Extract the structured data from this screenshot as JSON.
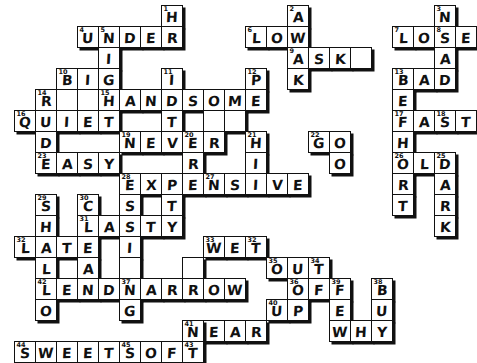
{
  "puzzle": {
    "type": "crossword",
    "title": "Opposites Crossword",
    "cell_size": 21,
    "origin": {
      "x": 14,
      "y": 5
    },
    "across_answers": [
      "UNDER",
      "LOW",
      "LOSE",
      "ASK",
      "BAD",
      "BIG",
      "HANDSOME",
      "QUIET",
      "EAST",
      "NEVER",
      "EASY",
      "EXPENSIVE",
      "OLD",
      "LAST",
      "LATE",
      "WET",
      "NARROW",
      "OUT",
      "LEND",
      "OF",
      "UP",
      "NEAR",
      "WHY",
      "SWEET",
      "SOFT"
    ],
    "down_answers": [
      "HIGH",
      "AWAKE",
      "NOISY",
      "SAD",
      "PRETTY",
      "BEFORE",
      "MORE",
      "SHORT",
      "DARK",
      "HIGH",
      "GOOD",
      "SHALLOW",
      "CLEAN",
      "THIN",
      "TIDY",
      "BUSY"
    ],
    "cells": [
      {
        "r": 0,
        "c": 7,
        "letter": "H",
        "num": "1"
      },
      {
        "r": 0,
        "c": 13,
        "letter": "A",
        "num": "2"
      },
      {
        "r": 0,
        "c": 20,
        "letter": "N",
        "num": "3"
      },
      {
        "r": 1,
        "c": 3,
        "letter": "U",
        "num": "4"
      },
      {
        "r": 1,
        "c": 4,
        "letter": "N",
        "num": "5"
      },
      {
        "r": 1,
        "c": 5,
        "letter": "D",
        "num": ""
      },
      {
        "r": 1,
        "c": 6,
        "letter": "E",
        "num": ""
      },
      {
        "r": 1,
        "c": 7,
        "letter": "R",
        "num": ""
      },
      {
        "r": 1,
        "c": 11,
        "letter": "L",
        "num": "6"
      },
      {
        "r": 1,
        "c": 12,
        "letter": "O",
        "num": ""
      },
      {
        "r": 1,
        "c": 13,
        "letter": "W",
        "num": ""
      },
      {
        "r": 1,
        "c": 18,
        "letter": "L",
        "num": "7"
      },
      {
        "r": 1,
        "c": 19,
        "letter": "O",
        "num": ""
      },
      {
        "r": 1,
        "c": 20,
        "letter": "S",
        "num": "8"
      },
      {
        "r": 1,
        "c": 21,
        "letter": "E",
        "num": ""
      },
      {
        "r": 2,
        "c": 4,
        "letter": "I",
        "num": ""
      },
      {
        "r": 2,
        "c": 13,
        "letter": "A",
        "num": "9"
      },
      {
        "r": 2,
        "c": 14,
        "letter": "S",
        "num": ""
      },
      {
        "r": 2,
        "c": 15,
        "letter": "K",
        "num": ""
      },
      {
        "r": 2,
        "c": 16,
        "letter": "",
        "num": ""
      },
      {
        "r": 2,
        "c": 20,
        "letter": "A",
        "num": ""
      },
      {
        "r": 3,
        "c": 2,
        "letter": "B",
        "num": "10"
      },
      {
        "r": 3,
        "c": 3,
        "letter": "I",
        "num": ""
      },
      {
        "r": 3,
        "c": 4,
        "letter": "G",
        "num": ""
      },
      {
        "r": 3,
        "c": 7,
        "letter": "I",
        "num": "11"
      },
      {
        "r": 3,
        "c": 11,
        "letter": "P",
        "num": "12"
      },
      {
        "r": 3,
        "c": 13,
        "letter": "K",
        "num": ""
      },
      {
        "r": 3,
        "c": 18,
        "letter": "B",
        "num": "13"
      },
      {
        "r": 3,
        "c": 19,
        "letter": "A",
        "num": ""
      },
      {
        "r": 3,
        "c": 20,
        "letter": "D",
        "num": ""
      },
      {
        "r": 4,
        "c": 1,
        "letter": "R",
        "num": "14"
      },
      {
        "r": 4,
        "c": 2,
        "letter": "",
        "num": ""
      },
      {
        "r": 4,
        "c": 3,
        "letter": "",
        "num": ""
      },
      {
        "r": 4,
        "c": 4,
        "letter": "H",
        "num": "15"
      },
      {
        "r": 4,
        "c": 5,
        "letter": "A",
        "num": ""
      },
      {
        "r": 4,
        "c": 6,
        "letter": "N",
        "num": ""
      },
      {
        "r": 4,
        "c": 7,
        "letter": "D",
        "num": ""
      },
      {
        "r": 4,
        "c": 8,
        "letter": "S",
        "num": ""
      },
      {
        "r": 4,
        "c": 9,
        "letter": "O",
        "num": ""
      },
      {
        "r": 4,
        "c": 10,
        "letter": "M",
        "num": ""
      },
      {
        "r": 4,
        "c": 11,
        "letter": "E",
        "num": ""
      },
      {
        "r": 4,
        "c": 18,
        "letter": "E",
        "num": ""
      },
      {
        "r": 5,
        "c": 0,
        "letter": "Q",
        "num": "16"
      },
      {
        "r": 5,
        "c": 1,
        "letter": "U",
        "num": ""
      },
      {
        "r": 5,
        "c": 2,
        "letter": "I",
        "num": ""
      },
      {
        "r": 5,
        "c": 3,
        "letter": "E",
        "num": ""
      },
      {
        "r": 5,
        "c": 4,
        "letter": "T",
        "num": ""
      },
      {
        "r": 5,
        "c": 7,
        "letter": "T",
        "num": ""
      },
      {
        "r": 5,
        "c": 9,
        "letter": "",
        "num": ""
      },
      {
        "r": 5,
        "c": 10,
        "letter": "",
        "num": ""
      },
      {
        "r": 5,
        "c": 18,
        "letter": "F",
        "num": "17"
      },
      {
        "r": 5,
        "c": 19,
        "letter": "A",
        "num": ""
      },
      {
        "r": 5,
        "c": 20,
        "letter": "S",
        "num": "18"
      },
      {
        "r": 5,
        "c": 21,
        "letter": "T",
        "num": ""
      },
      {
        "r": 6,
        "c": 1,
        "letter": "D",
        "num": ""
      },
      {
        "r": 6,
        "c": 5,
        "letter": "N",
        "num": "19"
      },
      {
        "r": 6,
        "c": 6,
        "letter": "E",
        "num": ""
      },
      {
        "r": 6,
        "c": 7,
        "letter": "V",
        "num": ""
      },
      {
        "r": 6,
        "c": 8,
        "letter": "E",
        "num": "20"
      },
      {
        "r": 6,
        "c": 9,
        "letter": "R",
        "num": ""
      },
      {
        "r": 6,
        "c": 11,
        "letter": "H",
        "num": "21"
      },
      {
        "r": 6,
        "c": 14,
        "letter": "G",
        "num": "22"
      },
      {
        "r": 6,
        "c": 15,
        "letter": "O",
        "num": ""
      },
      {
        "r": 6,
        "c": 18,
        "letter": "H",
        "num": ""
      },
      {
        "r": 7,
        "c": 1,
        "letter": "E",
        "num": "23"
      },
      {
        "r": 7,
        "c": 2,
        "letter": "A",
        "num": ""
      },
      {
        "r": 7,
        "c": 3,
        "letter": "S",
        "num": ""
      },
      {
        "r": 7,
        "c": 4,
        "letter": "Y",
        "num": ""
      },
      {
        "r": 7,
        "c": 8,
        "letter": "R",
        "num": ""
      },
      {
        "r": 7,
        "c": 11,
        "letter": "I",
        "num": ""
      },
      {
        "r": 7,
        "c": 15,
        "letter": "O",
        "num": ""
      },
      {
        "r": 7,
        "c": 18,
        "letter": "O",
        "num": "26"
      },
      {
        "r": 7,
        "c": 19,
        "letter": "L",
        "num": ""
      },
      {
        "r": 7,
        "c": 20,
        "letter": "D",
        "num": "25"
      },
      {
        "r": 8,
        "c": 5,
        "letter": "E",
        "num": "28"
      },
      {
        "r": 8,
        "c": 6,
        "letter": "X",
        "num": ""
      },
      {
        "r": 8,
        "c": 7,
        "letter": "P",
        "num": ""
      },
      {
        "r": 8,
        "c": 8,
        "letter": "E",
        "num": ""
      },
      {
        "r": 8,
        "c": 9,
        "letter": "N",
        "num": "27"
      },
      {
        "r": 8,
        "c": 10,
        "letter": "S",
        "num": ""
      },
      {
        "r": 8,
        "c": 11,
        "letter": "I",
        "num": ""
      },
      {
        "r": 8,
        "c": 12,
        "letter": "V",
        "num": ""
      },
      {
        "r": 8,
        "c": 13,
        "letter": "E",
        "num": ""
      },
      {
        "r": 8,
        "c": 18,
        "letter": "R",
        "num": ""
      },
      {
        "r": 8,
        "c": 20,
        "letter": "A",
        "num": ""
      },
      {
        "r": 9,
        "c": 1,
        "letter": "S",
        "num": "29"
      },
      {
        "r": 9,
        "c": 3,
        "letter": "C",
        "num": "30"
      },
      {
        "r": 9,
        "c": 5,
        "letter": "S",
        "num": ""
      },
      {
        "r": 9,
        "c": 7,
        "letter": "T",
        "num": ""
      },
      {
        "r": 9,
        "c": 18,
        "letter": "T",
        "num": ""
      },
      {
        "r": 9,
        "c": 20,
        "letter": "R",
        "num": ""
      },
      {
        "r": 10,
        "c": 1,
        "letter": "H",
        "num": ""
      },
      {
        "r": 10,
        "c": 3,
        "letter": "L",
        "num": "31"
      },
      {
        "r": 10,
        "c": 4,
        "letter": "A",
        "num": ""
      },
      {
        "r": 10,
        "c": 5,
        "letter": "S",
        "num": ""
      },
      {
        "r": 10,
        "c": 6,
        "letter": "T",
        "num": ""
      },
      {
        "r": 10,
        "c": 7,
        "letter": "Y",
        "num": ""
      },
      {
        "r": 10,
        "c": 20,
        "letter": "K",
        "num": ""
      },
      {
        "r": 11,
        "c": 0,
        "letter": "L",
        "num": "32"
      },
      {
        "r": 11,
        "c": 1,
        "letter": "A",
        "num": ""
      },
      {
        "r": 11,
        "c": 2,
        "letter": "T",
        "num": ""
      },
      {
        "r": 11,
        "c": 3,
        "letter": "E",
        "num": ""
      },
      {
        "r": 11,
        "c": 5,
        "letter": "I",
        "num": ""
      },
      {
        "r": 11,
        "c": 9,
        "letter": "W",
        "num": "33"
      },
      {
        "r": 11,
        "c": 10,
        "letter": "E",
        "num": ""
      },
      {
        "r": 11,
        "c": 11,
        "letter": "T",
        "num": "32"
      },
      {
        "r": 12,
        "c": 1,
        "letter": "L",
        "num": ""
      },
      {
        "r": 12,
        "c": 3,
        "letter": "A",
        "num": ""
      },
      {
        "r": 12,
        "c": 5,
        "letter": "",
        "num": ""
      },
      {
        "r": 12,
        "c": 8,
        "letter": "",
        "num": ""
      },
      {
        "r": 12,
        "c": 12,
        "letter": "O",
        "num": "35"
      },
      {
        "r": 12,
        "c": 13,
        "letter": "U",
        "num": ""
      },
      {
        "r": 12,
        "c": 14,
        "letter": "T",
        "num": "34"
      },
      {
        "r": 13,
        "c": 1,
        "letter": "L",
        "num": "42"
      },
      {
        "r": 13,
        "c": 2,
        "letter": "E",
        "num": ""
      },
      {
        "r": 13,
        "c": 3,
        "letter": "N",
        "num": ""
      },
      {
        "r": 13,
        "c": 4,
        "letter": "D",
        "num": ""
      },
      {
        "r": 13,
        "c": 5,
        "letter": "N",
        "num": "37"
      },
      {
        "r": 13,
        "c": 6,
        "letter": "A",
        "num": ""
      },
      {
        "r": 13,
        "c": 7,
        "letter": "R",
        "num": ""
      },
      {
        "r": 13,
        "c": 8,
        "letter": "R",
        "num": ""
      },
      {
        "r": 13,
        "c": 9,
        "letter": "O",
        "num": ""
      },
      {
        "r": 13,
        "c": 10,
        "letter": "W",
        "num": ""
      },
      {
        "r": 13,
        "c": 13,
        "letter": "O",
        "num": "36"
      },
      {
        "r": 13,
        "c": 14,
        "letter": "F",
        "num": ""
      },
      {
        "r": 13,
        "c": 15,
        "letter": "F",
        "num": "39"
      },
      {
        "r": 13,
        "c": 17,
        "letter": "B",
        "num": "38"
      },
      {
        "r": 14,
        "c": 1,
        "letter": "O",
        "num": ""
      },
      {
        "r": 14,
        "c": 5,
        "letter": "G",
        "num": ""
      },
      {
        "r": 14,
        "c": 12,
        "letter": "U",
        "num": "40"
      },
      {
        "r": 14,
        "c": 13,
        "letter": "P",
        "num": ""
      },
      {
        "r": 14,
        "c": 15,
        "letter": "E",
        "num": ""
      },
      {
        "r": 14,
        "c": 17,
        "letter": "U",
        "num": ""
      },
      {
        "r": 15,
        "c": 9,
        "letter": "E",
        "num": ""
      },
      {
        "r": 15,
        "c": 10,
        "letter": "A",
        "num": ""
      },
      {
        "r": 15,
        "c": 11,
        "letter": "R",
        "num": ""
      },
      {
        "r": 15,
        "c": 8,
        "letter": "N",
        "num": "41"
      },
      {
        "r": 15,
        "c": 15,
        "letter": "W",
        "num": ""
      },
      {
        "r": 15,
        "c": 16,
        "letter": "H",
        "num": ""
      },
      {
        "r": 15,
        "c": 17,
        "letter": "Y",
        "num": ""
      },
      {
        "r": 16,
        "c": 0,
        "letter": "S",
        "num": "44"
      },
      {
        "r": 16,
        "c": 1,
        "letter": "W",
        "num": ""
      },
      {
        "r": 16,
        "c": 2,
        "letter": "E",
        "num": ""
      },
      {
        "r": 16,
        "c": 3,
        "letter": "E",
        "num": ""
      },
      {
        "r": 16,
        "c": 4,
        "letter": "T",
        "num": ""
      },
      {
        "r": 16,
        "c": 5,
        "letter": "S",
        "num": "45"
      },
      {
        "r": 16,
        "c": 6,
        "letter": "O",
        "num": ""
      },
      {
        "r": 16,
        "c": 7,
        "letter": "F",
        "num": ""
      },
      {
        "r": 16,
        "c": 8,
        "letter": "T",
        "num": "43"
      }
    ]
  }
}
